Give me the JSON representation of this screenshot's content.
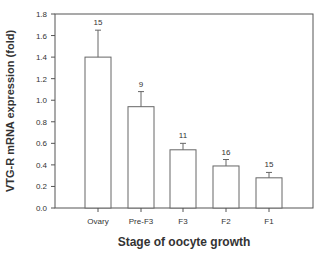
{
  "chart_data": {
    "type": "bar",
    "title": "",
    "xlabel": "Stage of oocyte growth",
    "ylabel": "VTG-R mRNA expression (fold)",
    "ylim": [
      0,
      1.8
    ],
    "yticks": [
      "0.0",
      "0.2",
      "0.4",
      "0.6",
      "0.8",
      "1.0",
      "1.2",
      "1.4",
      "1.6",
      "1.8"
    ],
    "grid": false,
    "legend": null,
    "categories": [
      "Ovary",
      "Pre-F3",
      "F3",
      "F2",
      "F1"
    ],
    "values": [
      1.4,
      0.94,
      0.54,
      0.39,
      0.28
    ],
    "error_upper": [
      0.25,
      0.14,
      0.06,
      0.06,
      0.05
    ],
    "annotations": [
      "15",
      "9",
      "11",
      "16",
      "15"
    ],
    "annotation_meaning": "sample size (n) above each bar"
  },
  "colors": {
    "axis": "#555555",
    "bar_fill": "#ffffff",
    "bar_stroke": "#666666",
    "text": "#333333"
  }
}
